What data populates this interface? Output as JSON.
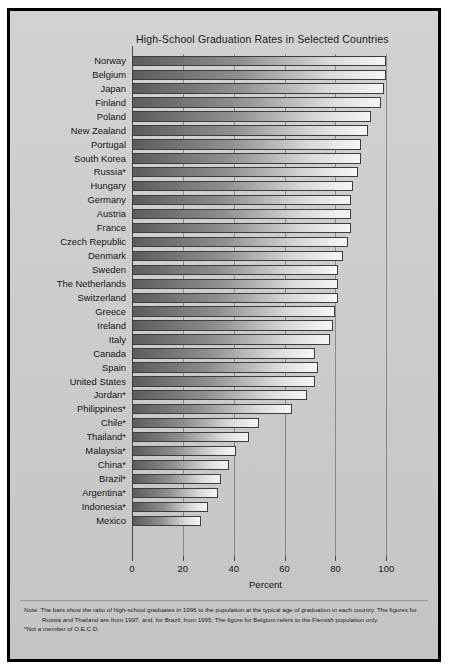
{
  "chart_data": {
    "type": "bar",
    "orientation": "horizontal",
    "title": "High-School Graduation Rates in Selected Countries",
    "xlabel": "Percent",
    "ylabel": "",
    "xlim": [
      0,
      105
    ],
    "xticks": [
      0,
      20,
      40,
      60,
      80,
      100
    ],
    "grid": true,
    "legend": "none",
    "categories": [
      "Norway",
      "Belgium",
      "Japan",
      "Finland",
      "Poland",
      "New Zealand",
      "Portugal",
      "South Korea",
      "Russia*",
      "Hungary",
      "Germany",
      "Austria",
      "France",
      "Czech Republic",
      "Denmark",
      "Sweden",
      "The Netherlands",
      "Switzerland",
      "Greece",
      "Ireland",
      "Italy",
      "Canada",
      "Spain",
      "United States",
      "Jordan*",
      "Philippines*",
      "Chile*",
      "Thailand*",
      "Malaysia*",
      "China*",
      "Brazil*",
      "Argentina*",
      "Indonesia*",
      "Mexico"
    ],
    "values": [
      100,
      100,
      99,
      98,
      94,
      93,
      90,
      90,
      89,
      87,
      86,
      86,
      86,
      85,
      83,
      81,
      81,
      81,
      80,
      79,
      78,
      72,
      73,
      72,
      69,
      63,
      50,
      46,
      41,
      38,
      35,
      34,
      30,
      27
    ],
    "annotations": [
      "Note: The bars show the ratio of high-school graduates in 1996 to the population at the typical age of graduation in each country. The figures for Russia and Thailand are from 1997, and, for Brazil, from 1995. The figure for Belgium refers to the Flemish population only.",
      "*Not a member of O.E.C.D."
    ]
  },
  "footnote": {
    "note": "Note: The bars show the ratio of high-school graduates in 1996 to the population at the typical age of graduation in each country. The figures for Russia and Thailand are from 1997, and, for Brazil, from 1995. The figure for Belgium refers to the Flemish population only.",
    "asterisk": "*Not a member of O.E.C.D."
  },
  "colors": {
    "frame": "#000000",
    "plate": "#cfcfcf",
    "bar_dark": "#5c5c5c",
    "bar_light": "#f6f6f6",
    "axis": "#4a4a4a"
  }
}
